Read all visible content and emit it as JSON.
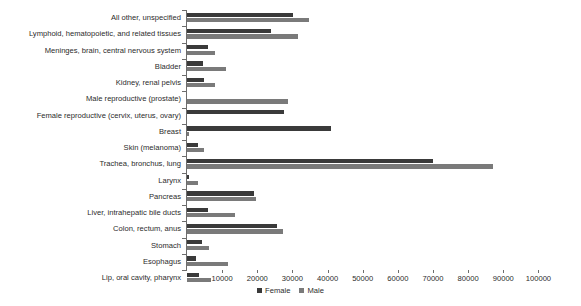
{
  "chart_data": {
    "type": "bar",
    "orientation": "horizontal",
    "title": "",
    "xlabel": "",
    "ylabel": "",
    "xlim": [
      0,
      105000
    ],
    "grid": false,
    "legend_position": "bottom-center",
    "xticks": [
      10000,
      20000,
      30000,
      40000,
      50000,
      60000,
      70000,
      80000,
      90000,
      100000
    ],
    "xticklabels": [
      "10000",
      "20000",
      "30000",
      "40000",
      "50000",
      "60000",
      "70000",
      "80000",
      "90000",
      "100000"
    ],
    "categories": [
      "All other, unspecified",
      "Lymphoid, hematopoietic, and related tissues",
      "Meninges, brain, central nervous system",
      "Bladder",
      "Kidney, renal pelvis",
      "Male reproductive (prostate)",
      "Female reproductive (cervix, uterus, ovary)",
      "Breast",
      "Skin (melanoma)",
      "Trachea, bronchus, lung",
      "Larynx",
      "Pancreas",
      "Liver, intrahepatic bile ducts",
      "Colon, rectum, anus",
      "Stomach",
      "Esophagus",
      "Lip, oral cavity, pharynx"
    ],
    "series": [
      {
        "name": "Female",
        "color": "#3a3a3a",
        "values": [
          30200,
          24000,
          6000,
          4600,
          4900,
          0,
          27700,
          41000,
          3000,
          70000,
          700,
          19000,
          6000,
          25600,
          4400,
          2500,
          3300
        ]
      },
      {
        "name": "Male",
        "color": "#7a7a7a",
        "values": [
          34600,
          31600,
          8000,
          11000,
          8000,
          28800,
          0,
          500,
          4900,
          87000,
          3000,
          19500,
          13600,
          27200,
          6300,
          11700,
          6800
        ]
      }
    ]
  },
  "legend": {
    "items": [
      {
        "label": "Female",
        "color": "#3a3a3a"
      },
      {
        "label": "Male",
        "color": "#7a7a7a"
      }
    ]
  }
}
